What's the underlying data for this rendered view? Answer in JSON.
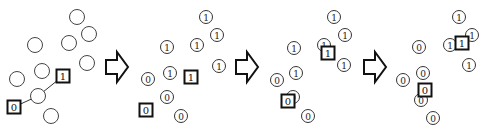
{
  "arrows": [
    {
      "name": "step-arrow-1",
      "x": 106,
      "y": 52
    },
    {
      "name": "step-arrow-2",
      "x": 236,
      "y": 52
    },
    {
      "name": "step-arrow-3",
      "x": 364,
      "y": 52
    }
  ],
  "panels": [
    {
      "name": "initial",
      "points": [
        {
          "x": 77,
          "y": 17,
          "label": ""
        },
        {
          "x": 89,
          "y": 34,
          "label": ""
        },
        {
          "x": 35,
          "y": 45,
          "label": ""
        },
        {
          "x": 69,
          "y": 43,
          "label": ""
        },
        {
          "x": 87,
          "y": 63,
          "label": ""
        },
        {
          "x": 42,
          "y": 71,
          "label": ""
        },
        {
          "x": 17,
          "y": 79,
          "label": ""
        },
        {
          "x": 38,
          "y": 96,
          "label": ""
        },
        {
          "x": 51,
          "y": 116,
          "label": ""
        }
      ],
      "centroids": [
        {
          "x": 14,
          "y": 107,
          "label": "0"
        },
        {
          "x": 63,
          "y": 76,
          "label": "1"
        }
      ],
      "links": [
        {
          "x1": 14,
          "y1": 107,
          "x2": 38,
          "y2": 96
        },
        {
          "x1": 38,
          "y1": 96,
          "x2": 63,
          "y2": 76
        }
      ]
    },
    {
      "name": "assign-1",
      "points": [
        {
          "x": 206,
          "y": 17,
          "label": "1"
        },
        {
          "x": 217,
          "y": 35,
          "label": "1"
        },
        {
          "x": 167,
          "y": 47,
          "label": "1"
        },
        {
          "x": 197,
          "y": 45,
          "label": "1"
        },
        {
          "x": 219,
          "y": 66,
          "label": "1"
        },
        {
          "x": 170,
          "y": 73,
          "label": "1"
        },
        {
          "x": 148,
          "y": 79,
          "label": "0"
        },
        {
          "x": 167,
          "y": 97,
          "label": "0"
        },
        {
          "x": 181,
          "y": 116,
          "label": "0"
        }
      ],
      "centroids": [
        {
          "x": 146,
          "y": 110,
          "label": "0"
        },
        {
          "x": 191,
          "y": 77,
          "label": "1"
        }
      ],
      "links": []
    },
    {
      "name": "update-1",
      "points": [
        {
          "x": 334,
          "y": 17,
          "label": "1"
        },
        {
          "x": 345,
          "y": 35,
          "label": "1"
        },
        {
          "x": 294,
          "y": 48,
          "label": "1"
        },
        {
          "x": 324,
          "y": 45,
          "label": "1"
        },
        {
          "x": 344,
          "y": 65,
          "label": "1"
        },
        {
          "x": 296,
          "y": 73,
          "label": "1"
        },
        {
          "x": 277,
          "y": 80,
          "label": "0"
        },
        {
          "x": 293,
          "y": 97,
          "label": "0"
        },
        {
          "x": 308,
          "y": 116,
          "label": "0"
        }
      ],
      "centroids": [
        {
          "x": 288,
          "y": 101,
          "label": "0"
        },
        {
          "x": 328,
          "y": 53,
          "label": "1"
        }
      ],
      "links": []
    },
    {
      "name": "assign-2",
      "points": [
        {
          "x": 459,
          "y": 17,
          "label": "1"
        },
        {
          "x": 472,
          "y": 35,
          "label": "1"
        },
        {
          "x": 450,
          "y": 45,
          "label": "1"
        },
        {
          "x": 469,
          "y": 65,
          "label": "1"
        },
        {
          "x": 419,
          "y": 47,
          "label": "0"
        },
        {
          "x": 403,
          "y": 80,
          "label": "0"
        },
        {
          "x": 423,
          "y": 73,
          "label": "0"
        },
        {
          "x": 421,
          "y": 100,
          "label": "0"
        },
        {
          "x": 433,
          "y": 118,
          "label": "0"
        }
      ],
      "centroids": [
        {
          "x": 425,
          "y": 90,
          "label": "0"
        },
        {
          "x": 462,
          "y": 43,
          "label": "1"
        }
      ],
      "links": []
    }
  ]
}
